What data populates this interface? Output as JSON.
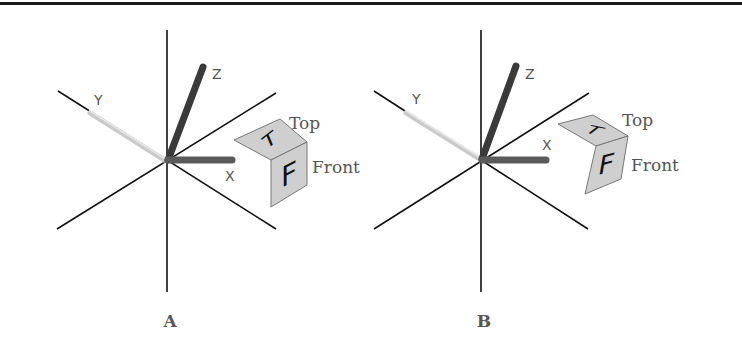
{
  "figure": {
    "panels": [
      {
        "id": "A",
        "label": "A",
        "axes": {
          "x_label": "X",
          "y_label": "Y",
          "z_label": "Z"
        },
        "cube": {
          "top_face_letter": "T",
          "front_face_letter": "F",
          "top_label": "Top",
          "front_label": "Front"
        }
      },
      {
        "id": "B",
        "label": "B",
        "axes": {
          "x_label": "X",
          "y_label": "Y",
          "z_label": "Z"
        },
        "cube": {
          "top_face_letter": "T",
          "front_face_letter": "F",
          "top_label": "Top",
          "front_label": "Front"
        }
      }
    ],
    "colors": {
      "background": "#ffffff",
      "line": "#111111",
      "z_rod": "#3a3a3a",
      "x_rod": "#5a5a5a",
      "y_rod": "#d0d0d0",
      "cube_face": "#cfcfcf",
      "cube_edge": "#777777",
      "label_text": "#555555"
    }
  }
}
